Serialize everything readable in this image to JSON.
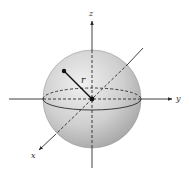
{
  "figure": {
    "labels": {
      "x_axis": "x",
      "y_axis": "y",
      "z_axis": "z",
      "radius": "r"
    },
    "colors": {
      "sphere_light": "#eeeeee",
      "sphere_dark": "#a9a9a9",
      "line": "#2a2a2a",
      "point": "#111111"
    }
  }
}
